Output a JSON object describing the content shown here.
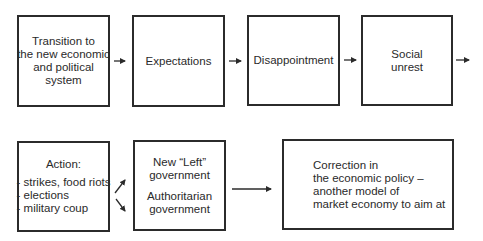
{
  "diagram": {
    "row1": [
      {
        "id": "transition",
        "lines": [
          "Transition to",
          "the new economic",
          "and political",
          "system"
        ]
      },
      {
        "id": "expectations",
        "lines": [
          "Expectations"
        ]
      },
      {
        "id": "disappointment",
        "lines": [
          "Disappointment"
        ]
      },
      {
        "id": "social-unrest",
        "lines": [
          "Social",
          "unrest"
        ]
      }
    ],
    "row2": {
      "action": {
        "title": "Action:",
        "items": [
          "- strikes, food riots",
          "- elections",
          "- military coup"
        ]
      },
      "government": {
        "option1": [
          "New “Left”",
          "government"
        ],
        "option2": [
          "Authoritarian",
          "government"
        ]
      },
      "correction": {
        "lines": [
          "Correction in",
          "the economic policy –",
          "another model of",
          "market economy to aim at"
        ]
      }
    },
    "colors": {
      "line": "#2b2b2b",
      "text": "#2a2a2a",
      "background": "#ffffff"
    }
  }
}
